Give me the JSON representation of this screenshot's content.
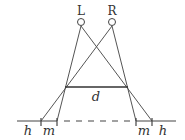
{
  "diagram": {
    "nodes": {
      "left": {
        "label": "L",
        "x": 81,
        "y": 22
      },
      "right": {
        "label": "R",
        "x": 112,
        "y": 22
      }
    },
    "segment_label": "d",
    "baseline_labels": {
      "left_outer": "h",
      "left_inner": "m",
      "right_inner": "m",
      "right_outer": "h"
    },
    "colors": {
      "stroke": "#444444",
      "text": "#333333"
    }
  }
}
